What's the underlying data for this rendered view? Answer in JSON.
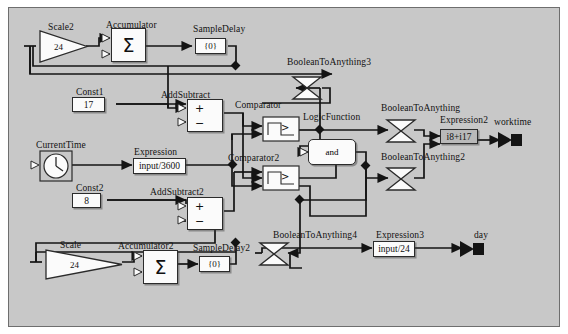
{
  "diagram": {
    "type": "block-diagram",
    "background_color": "#c8c8c8",
    "frame_border_color": "#6e6e6e",
    "blocks": [
      {
        "id": "scale2",
        "name": "Scale2",
        "label": "Scale2",
        "value": "24",
        "shape": "triangle"
      },
      {
        "id": "accumulator",
        "name": "Accumulator",
        "label": "Accumulator",
        "value": "Σ",
        "shape": "box"
      },
      {
        "id": "sampledelay",
        "name": "SampleDelay",
        "label": "SampleDelay",
        "value": "{0}",
        "shape": "box"
      },
      {
        "id": "booleantoanything3",
        "name": "BooleanToAnything3",
        "label": "BooleanToAnything3",
        "value": "",
        "shape": "bowtie"
      },
      {
        "id": "const1",
        "name": "Const1",
        "label": "Const1",
        "value": "17",
        "shape": "box"
      },
      {
        "id": "addsubtract",
        "name": "AddSubtract",
        "label": "AddSubtract",
        "value": "+−",
        "shape": "addsub"
      },
      {
        "id": "comparator",
        "name": "Comparator",
        "label": "Comparator",
        "value": ">",
        "shape": "comparator"
      },
      {
        "id": "logicfunction",
        "name": "LogicFunction",
        "label": "LogicFunction",
        "value": "and",
        "shape": "rounded-box"
      },
      {
        "id": "booleantoanything",
        "name": "BooleanToAnything",
        "label": "BooleanToAnything",
        "value": "",
        "shape": "bowtie"
      },
      {
        "id": "expression2",
        "name": "Expression2",
        "label": "Expression2",
        "value": "i8+i17",
        "shape": "box"
      },
      {
        "id": "currenttime",
        "name": "CurrentTime",
        "label": "CurrentTime",
        "value": "clock",
        "shape": "clock"
      },
      {
        "id": "expression",
        "name": "Expression",
        "label": "Expression",
        "value": "input/3600",
        "shape": "box"
      },
      {
        "id": "comparator2",
        "name": "Comparator2",
        "label": "Comparator2",
        "value": ">",
        "shape": "comparator"
      },
      {
        "id": "booleantoanything2",
        "name": "BooleanToAnything2",
        "label": "BooleanToAnything2",
        "value": "",
        "shape": "bowtie"
      },
      {
        "id": "const2",
        "name": "Const2",
        "label": "Const2",
        "value": "8",
        "shape": "box"
      },
      {
        "id": "addsubtract2",
        "name": "AddSubtract2",
        "label": "AddSubtract2",
        "value": "+−",
        "shape": "addsub"
      },
      {
        "id": "booleantoanything4",
        "name": "BooleanToAnything4",
        "label": "BooleanToAnything4",
        "value": "",
        "shape": "bowtie"
      },
      {
        "id": "expression3",
        "name": "Expression3",
        "label": "Expression3",
        "value": "input/24",
        "shape": "box"
      },
      {
        "id": "scale",
        "name": "Scale",
        "label": "Scale",
        "value": "24",
        "shape": "triangle"
      },
      {
        "id": "accumulator2",
        "name": "Accumulator2",
        "label": "Accumulator2",
        "value": "Σ",
        "shape": "box"
      },
      {
        "id": "sampledelay2",
        "name": "SampleDelay2",
        "label": "SampleDelay2",
        "value": "{0}",
        "shape": "box"
      }
    ],
    "outputs": [
      {
        "id": "worktime",
        "label": "worktime"
      },
      {
        "id": "day",
        "label": "day"
      }
    ]
  },
  "labels": {
    "scale2": "Scale2",
    "scale2_value": "24",
    "accumulator": "Accumulator",
    "accumulator_value": "Σ",
    "sampledelay": "SampleDelay",
    "sampledelay_value": "{0}",
    "booleantoanything3": "BooleanToAnything3",
    "const1": "Const1",
    "const1_value": "17",
    "addsubtract": "AddSubtract",
    "comparator": "Comparator",
    "comparator_value": ">",
    "logicfunction": "LogicFunction",
    "logicfunction_value": "and",
    "booleantoanything": "BooleanToAnything",
    "expression2": "Expression2",
    "expression2_value": "i8+i17",
    "worktime": "worktime",
    "currenttime": "CurrentTime",
    "expression": "Expression",
    "expression_value": "input/3600",
    "comparator2": "Comparator2",
    "comparator2_value": ">",
    "booleantoanything2": "BooleanToAnything2",
    "const2": "Const2",
    "const2_value": "8",
    "addsubtract2": "AddSubtract2",
    "booleantoanything4": "BooleanToAnything4",
    "expression3": "Expression3",
    "expression3_value": "input/24",
    "day": "day",
    "scale": "Scale",
    "scale_value": "24",
    "accumulator2": "Accumulator2",
    "accumulator2_value": "Σ",
    "sampledelay2": "SampleDelay2",
    "sampledelay2_value": "{0}",
    "plus": "+",
    "minus": "−"
  }
}
